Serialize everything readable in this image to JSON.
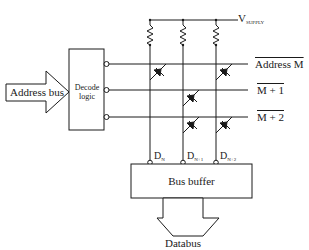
{
  "diagram": {
    "type": "memory-diode-matrix",
    "supply_label": {
      "main": "V",
      "sub": "SUPPLY"
    },
    "address_bus_label": "Address bus",
    "decoder_label_line1": "Decode",
    "decoder_label_line2": "logic",
    "rows": [
      {
        "label": "Address M",
        "overline": true
      },
      {
        "label": "M + 1",
        "overline": true
      },
      {
        "label": "M + 2",
        "overline": true
      }
    ],
    "columns": [
      {
        "main": "D",
        "sub": "N"
      },
      {
        "main": "D",
        "sub": "N+1"
      },
      {
        "main": "D",
        "sub": "N+2"
      }
    ],
    "diodes": [
      {
        "row": 0,
        "col": 0
      },
      {
        "row": 0,
        "col": 2
      },
      {
        "row": 1,
        "col": 1
      },
      {
        "row": 2,
        "col": 1
      },
      {
        "row": 2,
        "col": 2
      }
    ],
    "bus_buffer_label": "Bus buffer",
    "databus_label": "Databus",
    "colors": {
      "line": "#1a1a1a",
      "background": "#ffffff"
    }
  }
}
